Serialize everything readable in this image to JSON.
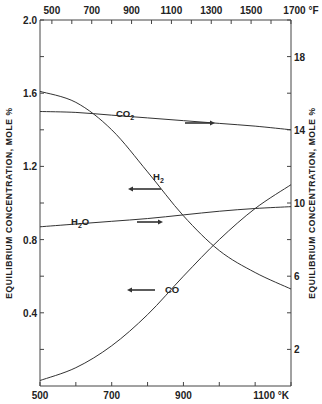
{
  "chart_data": {
    "type": "line",
    "title": "",
    "xlabel_bottom": "°K",
    "xlabel_top": "°F",
    "ylabel_left": "EQUILIBRIUM CONCENTRATION, MOLE %",
    "ylabel_right": "EQUILIBRIUM CONCENTRATION, MOLE %",
    "xlim_K": [
      500,
      1200
    ],
    "ylim_left": [
      0,
      2.0
    ],
    "ylim_right": [
      0,
      20
    ],
    "bottom_ticks": [
      "500",
      "700",
      "900",
      "1100 °K"
    ],
    "top_ticks": [
      "500",
      "700",
      "900",
      "1100",
      "1300",
      "1500",
      "1700 °F"
    ],
    "left_ticks": [
      "2.0",
      "1.6",
      "1.2",
      "0.8",
      "0.4"
    ],
    "right_ticks": [
      "18",
      "14",
      "10",
      "6",
      "2"
    ],
    "grid": false,
    "legend": "none (inline curve labels with arrows pointing to the axis used)",
    "series": [
      {
        "name": "CO2",
        "label": "CO₂",
        "axis": "right",
        "x": [
          500,
          600,
          700,
          800,
          900,
          1000,
          1100,
          1200
        ],
        "values": [
          15.0,
          14.95,
          14.8,
          14.65,
          14.5,
          14.35,
          14.2,
          14.0
        ]
      },
      {
        "name": "H2",
        "label": "H₂",
        "axis": "left",
        "x": [
          500,
          600,
          700,
          800,
          900,
          1000,
          1100,
          1200
        ],
        "values": [
          1.61,
          1.55,
          1.4,
          1.17,
          0.93,
          0.74,
          0.62,
          0.53
        ]
      },
      {
        "name": "H2O",
        "label": "H₂O",
        "axis": "right",
        "x": [
          500,
          600,
          700,
          800,
          900,
          1000,
          1100,
          1200
        ],
        "values": [
          8.7,
          8.85,
          9.0,
          9.15,
          9.35,
          9.55,
          9.7,
          9.8
        ]
      },
      {
        "name": "CO",
        "label": "CO",
        "axis": "left",
        "x": [
          500,
          600,
          700,
          800,
          900,
          1000,
          1100,
          1200
        ],
        "values": [
          0.03,
          0.1,
          0.22,
          0.39,
          0.6,
          0.8,
          0.97,
          1.1
        ]
      }
    ]
  },
  "labels": {
    "co2": "CO",
    "co2_sub": "2",
    "h2": "H",
    "h2_sub": "2",
    "h2o_h": "H",
    "h2o_sub": "2",
    "h2o_o": "O",
    "co": "CO",
    "unit_bottom": "°K",
    "unit_top": "°F"
  }
}
